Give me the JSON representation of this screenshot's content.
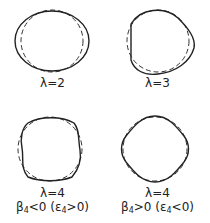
{
  "figure": {
    "panels": [
      {
        "id": "l2",
        "label": "λ=2",
        "sublabel": null,
        "shape": "quadrupole-ellipse"
      },
      {
        "id": "l3",
        "label": "λ=3",
        "sublabel": null,
        "shape": "octupole-pear"
      },
      {
        "id": "l4a",
        "label": "λ=4",
        "sublabel": {
          "beta": "β",
          "beta_idx": "4",
          "beta_rel": "<0 (ε",
          "eps_idx": "4",
          "eps_rel": ">0)"
        },
        "shape": "hexadecapole-square"
      },
      {
        "id": "l4b",
        "label": "λ=4",
        "sublabel": {
          "beta": "β",
          "beta_idx": "4",
          "beta_rel": ">0 (ε",
          "eps_idx": "4",
          "eps_rel": "<0)"
        },
        "shape": "hexadecapole-diamond"
      }
    ],
    "legend": {
      "solid": "deformed shape",
      "dashed": "spherical reference"
    },
    "colors": {
      "line": "#222222",
      "background": "#ffffff"
    }
  }
}
